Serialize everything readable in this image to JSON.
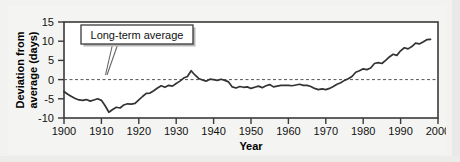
{
  "figure": {
    "background_color": "#f2f2f0",
    "plot_background_color": "#ffffff",
    "frame_color": "#3a3a3a"
  },
  "chart_data": {
    "type": "line",
    "title": "",
    "subtitle": "",
    "xlabel": "Year",
    "ylabel": "Deviation from average (days)",
    "xlim": [
      1900,
      2000
    ],
    "ylim": [
      -10,
      15
    ],
    "xticks": [
      1900,
      1910,
      1920,
      1930,
      1940,
      1950,
      1960,
      1970,
      1980,
      1990,
      2000
    ],
    "yticks": [
      -10,
      -5,
      0,
      5,
      10,
      15
    ],
    "xtick_labels": [
      "1900",
      "1910",
      "1920",
      "1930",
      "1940",
      "1950",
      "1960",
      "1970",
      "1980",
      "1990",
      "2000"
    ],
    "ytick_labels": [
      "-10",
      "-5",
      "0",
      "5",
      "10",
      "15"
    ],
    "grid": false,
    "legend": null,
    "series_color": "#333333",
    "reference_line": {
      "label": "Long-term average",
      "value": 0,
      "style": "dashed",
      "color": "#555555"
    },
    "annotations": [
      {
        "text": "Long-term average",
        "type": "callout-box",
        "points_to_x": 1913,
        "points_to_y": -1.2
      }
    ],
    "series": [
      {
        "name": "Deviation from average",
        "x": [
          1900,
          1901,
          1902,
          1903,
          1904,
          1905,
          1906,
          1907,
          1908,
          1909,
          1910,
          1911,
          1912,
          1913,
          1914,
          1915,
          1916,
          1917,
          1918,
          1919,
          1920,
          1921,
          1922,
          1923,
          1924,
          1925,
          1926,
          1927,
          1928,
          1929,
          1930,
          1931,
          1932,
          1933,
          1934,
          1935,
          1936,
          1937,
          1938,
          1939,
          1940,
          1941,
          1942,
          1943,
          1944,
          1945,
          1946,
          1947,
          1948,
          1949,
          1950,
          1951,
          1952,
          1953,
          1954,
          1955,
          1956,
          1957,
          1958,
          1959,
          1960,
          1961,
          1962,
          1963,
          1964,
          1965,
          1966,
          1967,
          1968,
          1969,
          1970,
          1971,
          1972,
          1973,
          1974,
          1975,
          1976,
          1977,
          1978,
          1979,
          1980,
          1981,
          1982,
          1983,
          1984,
          1985,
          1986,
          1987,
          1988,
          1989,
          1990,
          1991,
          1992,
          1993,
          1994,
          1995,
          1996,
          1997,
          1998
        ],
        "values": [
          -3.1,
          -3.8,
          -4.4,
          -4.9,
          -5.3,
          -5.4,
          -5.2,
          -5.6,
          -5.3,
          -5.0,
          -5.4,
          -6.8,
          -8.5,
          -7.8,
          -7.2,
          -7.4,
          -6.6,
          -6.3,
          -6.4,
          -6.2,
          -5.3,
          -4.4,
          -3.6,
          -3.5,
          -2.9,
          -2.2,
          -1.6,
          -2.0,
          -1.5,
          -1.7,
          -1.0,
          -0.4,
          0.4,
          0.8,
          2.3,
          1.2,
          0.3,
          -0.1,
          -0.4,
          0.1,
          0.0,
          -0.2,
          0.1,
          -0.2,
          -0.6,
          -1.9,
          -2.2,
          -1.8,
          -2.0,
          -1.9,
          -2.3,
          -2.0,
          -1.7,
          -2.1,
          -1.6,
          -1.3,
          -1.9,
          -1.7,
          -1.5,
          -1.5,
          -1.5,
          -1.6,
          -1.4,
          -1.2,
          -1.5,
          -1.5,
          -1.8,
          -2.3,
          -2.6,
          -2.4,
          -2.6,
          -2.3,
          -1.8,
          -1.2,
          -0.8,
          -0.2,
          0.2,
          0.8,
          1.9,
          2.3,
          2.8,
          2.6,
          3.0,
          4.2,
          4.4,
          4.2,
          5.0,
          5.9,
          6.6,
          6.3,
          7.5,
          8.3,
          8.0,
          8.6,
          9.5,
          9.3,
          9.8,
          10.4,
          10.5
        ]
      }
    ]
  }
}
